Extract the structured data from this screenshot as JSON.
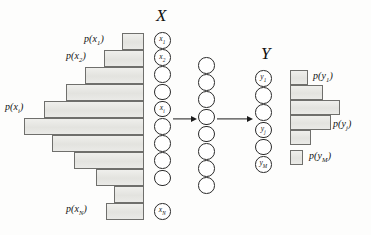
{
  "figure": {
    "width": 371,
    "height": 235,
    "background": "#fdfdfc",
    "bar_fill": "#e9e9e6",
    "bar_stroke": "#6f6f6c",
    "node_stroke": "#2a2a2a",
    "arrow_color": "#1c1c1c"
  },
  "headings": {
    "x_column": "X",
    "y_column": "Y"
  },
  "left_histogram": {
    "name": "p(x) distribution",
    "align": "right",
    "right_edge": 144,
    "bars": [
      {
        "label": "p(x_1)",
        "value": 22,
        "top": 33,
        "height": 17,
        "labeled": true
      },
      {
        "label": "",
        "value": 40,
        "top": 50,
        "height": 17,
        "labeled": true,
        "label_text": "p(x_2)"
      },
      {
        "label": "",
        "value": 59,
        "top": 67,
        "height": 17,
        "labeled": false
      },
      {
        "label": "",
        "value": 78,
        "top": 84,
        "height": 17,
        "labeled": false
      },
      {
        "label": "p(x_i)",
        "value": 100,
        "top": 101,
        "height": 17,
        "labeled": true
      },
      {
        "label": "",
        "value": 120,
        "top": 118,
        "height": 17,
        "labeled": false
      },
      {
        "label": "",
        "value": 92,
        "top": 135,
        "height": 17,
        "labeled": false
      },
      {
        "label": "",
        "value": 70,
        "top": 152,
        "height": 17,
        "labeled": false
      },
      {
        "label": "",
        "value": 48,
        "top": 169,
        "height": 17,
        "labeled": false
      },
      {
        "label": "p(x_N)",
        "value": 30,
        "top": 197,
        "height": 17,
        "labeled": true
      }
    ],
    "labels": {
      "first": "p(x",
      "first_sub": "1",
      "second_sub": "2",
      "middle_sub": "i",
      "last_sub": "N"
    }
  },
  "right_histogram": {
    "name": "p(y) distribution",
    "align": "left",
    "left_edge": 290,
    "bars": [
      {
        "value": 18,
        "top": 70,
        "height": 15,
        "labeled": true,
        "label_sub": "1"
      },
      {
        "value": 33,
        "top": 85,
        "height": 15,
        "labeled": false,
        "label_sub": ""
      },
      {
        "value": 50,
        "top": 100,
        "height": 15,
        "labeled": false,
        "label_sub": ""
      },
      {
        "value": 41,
        "top": 115,
        "height": 15,
        "labeled": true,
        "label_sub": "j"
      },
      {
        "value": 21,
        "top": 130,
        "height": 15,
        "labeled": false,
        "label_sub": ""
      },
      {
        "value": 13,
        "top": 150,
        "height": 15,
        "labeled": true,
        "label_sub": "M"
      }
    ]
  },
  "x_nodes": {
    "name": "X layer",
    "count": 10,
    "cx": 162,
    "top": 32,
    "pitch": 17.2,
    "diameter": 16.5,
    "items": [
      {
        "label": "x",
        "sub": "1",
        "has_label": true
      },
      {
        "label": "x",
        "sub": "2",
        "has_label": true
      },
      {
        "label": "",
        "sub": "",
        "has_label": false
      },
      {
        "label": "",
        "sub": "",
        "has_label": false
      },
      {
        "label": "x",
        "sub": "i",
        "has_label": true
      },
      {
        "label": "",
        "sub": "",
        "has_label": false
      },
      {
        "label": "",
        "sub": "",
        "has_label": false
      },
      {
        "label": "",
        "sub": "",
        "has_label": false
      },
      {
        "label": "",
        "sub": "",
        "has_label": false
      },
      {
        "label": "x",
        "sub": "N",
        "has_label": true
      }
    ]
  },
  "hidden_nodes": {
    "name": "hidden layer",
    "count": 8,
    "cx": 206,
    "top": 57,
    "pitch": 17.2,
    "diameter": 16.5
  },
  "y_nodes": {
    "name": "Y layer",
    "count": 6,
    "cx": 263,
    "top": 70,
    "pitch": 17.2,
    "diameter": 16.5,
    "items": [
      {
        "label": "y",
        "sub": "1",
        "has_label": true
      },
      {
        "label": "",
        "sub": "",
        "has_label": false
      },
      {
        "label": "",
        "sub": "",
        "has_label": false
      },
      {
        "label": "y",
        "sub": "j",
        "has_label": true
      },
      {
        "label": "",
        "sub": "",
        "has_label": false
      },
      {
        "label": "y",
        "sub": "M",
        "has_label": true
      }
    ]
  },
  "arrows": [
    {
      "name": "x-to-hidden",
      "left": 173,
      "top": 120,
      "width": 24
    },
    {
      "name": "hidden-to-y",
      "left": 217,
      "top": 120,
      "width": 36
    }
  ],
  "text": {
    "p_open": "p(",
    "p_close": ")",
    "x_var": "x",
    "y_var": "y"
  }
}
